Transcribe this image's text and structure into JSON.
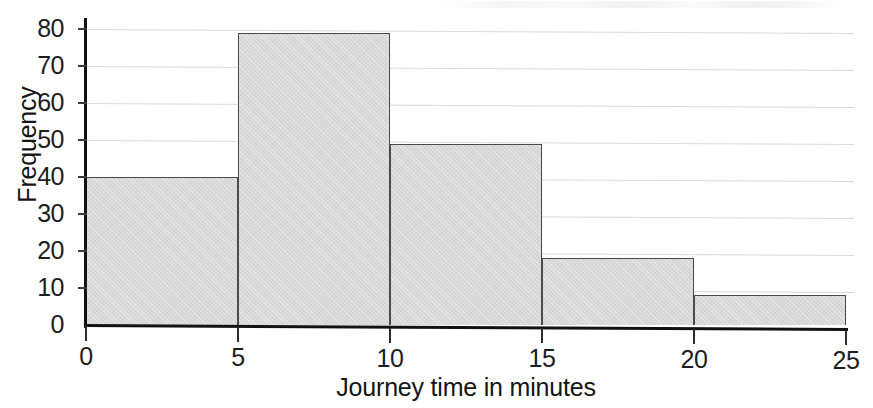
{
  "chart_data": {
    "type": "bar",
    "title": "",
    "subtitle": "",
    "xlabel": "Journey time in minutes",
    "ylabel": "Frequency",
    "categories": [
      "0-5",
      "5-10",
      "10-15",
      "15-20",
      "20-25"
    ],
    "bin_edges": [
      0,
      5,
      10,
      15,
      20,
      25
    ],
    "values": [
      40,
      79,
      49,
      18,
      8
    ],
    "x_ticks": [
      0,
      5,
      10,
      15,
      20,
      25
    ],
    "x_tick_labels": [
      "0",
      "5",
      "10",
      "15",
      "20",
      "25"
    ],
    "y_ticks": [
      0,
      10,
      20,
      30,
      40,
      50,
      60,
      70,
      80
    ],
    "y_tick_labels": [
      "0",
      "10",
      "20",
      "30",
      "40",
      "50",
      "60",
      "70",
      "80"
    ],
    "xlim": [
      0,
      25
    ],
    "ylim": [
      0,
      80
    ],
    "grid": true,
    "grid_axis": "y",
    "legend": false,
    "legend_position": "none",
    "bar_fill_color": "#d7d7d7",
    "bar_edge_color": "#4a4a4a",
    "axis_color": "#111111",
    "gridline_color": "#d9d9d9",
    "background_color": "#ffffff"
  }
}
